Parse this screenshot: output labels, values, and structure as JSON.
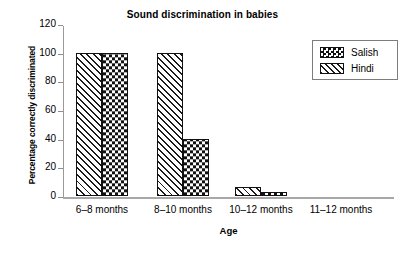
{
  "chart_data": {
    "type": "bar",
    "title": "Sound discrimination in babies",
    "xlabel": "Age",
    "ylabel": "Percentage correctly discriminated",
    "categories": [
      "6–8 months",
      "8–10 months",
      "10–12 months",
      "11–12 months"
    ],
    "series": [
      {
        "name": "Hindi",
        "pattern": "diagonal-hatch",
        "values": [
          100,
          100,
          6,
          0
        ]
      },
      {
        "name": "Salish",
        "pattern": "checkerboard",
        "values": [
          100,
          40,
          3,
          0
        ]
      }
    ],
    "ylim": [
      0,
      120
    ],
    "yticks": [
      0,
      20,
      40,
      60,
      80,
      100,
      120
    ],
    "ytick_labels": [
      "0",
      "20",
      "40",
      "60",
      "80",
      "100",
      "120"
    ],
    "grid": false,
    "legend_position": "top-right",
    "legend_entries": [
      "Salish",
      "Hindi"
    ],
    "bar_order_in_group": [
      "Hindi",
      "Salish"
    ],
    "colors": {
      "ink": "#111111",
      "axis": "#9a9a9a",
      "background": "#ffffff"
    }
  }
}
